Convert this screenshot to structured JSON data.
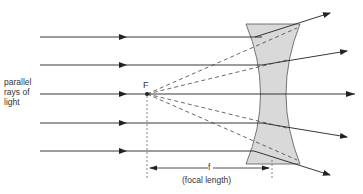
{
  "diagram": {
    "labels": {
      "parallel_rays": [
        "parallel",
        "rays of",
        "light"
      ],
      "focal_point": "F",
      "focal_symbol": "f",
      "focal_length": "(focal length)"
    },
    "colors": {
      "ray": "#222222",
      "lens_fill": "#d9d9d9",
      "lens_stroke": "#555555",
      "dashed": "#444444"
    },
    "rays_y": [
      37,
      65,
      94,
      123,
      151
    ]
  }
}
